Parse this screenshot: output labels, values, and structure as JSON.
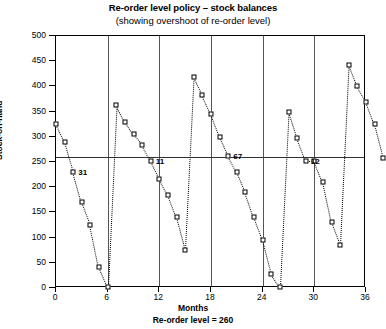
{
  "chart_data": {
    "type": "line",
    "title": "Re-order level policy – stock balances",
    "subtitle": "(showing overshoot of re-order level)",
    "xlabel": "Months",
    "ylabel": "Stock-on-hand",
    "footnote": "Re-order level = 260",
    "xlim": [
      0,
      36
    ],
    "ylim": [
      0,
      500
    ],
    "xticks": [
      0,
      6,
      12,
      18,
      24,
      30,
      36
    ],
    "yticks": [
      0,
      50,
      100,
      150,
      200,
      250,
      300,
      350,
      400,
      450,
      500
    ],
    "grid": "vertical-at-xticks",
    "legend": "none",
    "reorder_level": 260,
    "series": [
      {
        "name": "Stock-on-hand",
        "marker": "open-square",
        "linestyle": "dotted",
        "points": [
          {
            "x": 0,
            "y": 325
          },
          {
            "x": 1,
            "y": 290
          },
          {
            "x": 2,
            "y": 231
          },
          {
            "x": 3,
            "y": 170
          },
          {
            "x": 4,
            "y": 125
          },
          {
            "x": 5,
            "y": 42
          },
          {
            "x": 6,
            "y": 2
          },
          {
            "x": 7,
            "y": 363
          },
          {
            "x": 8,
            "y": 330
          },
          {
            "x": 9,
            "y": 305
          },
          {
            "x": 10,
            "y": 284
          },
          {
            "x": 11,
            "y": 252
          },
          {
            "x": 12,
            "y": 216
          },
          {
            "x": 13,
            "y": 185
          },
          {
            "x": 14,
            "y": 140
          },
          {
            "x": 15,
            "y": 75
          },
          {
            "x": 16,
            "y": 418
          },
          {
            "x": 17,
            "y": 382
          },
          {
            "x": 18,
            "y": 345
          },
          {
            "x": 19,
            "y": 300
          },
          {
            "x": 20,
            "y": 262
          },
          {
            "x": 21,
            "y": 230
          },
          {
            "x": 22,
            "y": 190
          },
          {
            "x": 23,
            "y": 140
          },
          {
            "x": 24,
            "y": 95
          },
          {
            "x": 25,
            "y": 28
          },
          {
            "x": 26,
            "y": 2
          },
          {
            "x": 27,
            "y": 350
          },
          {
            "x": 28,
            "y": 297
          },
          {
            "x": 29,
            "y": 252
          },
          {
            "x": 30,
            "y": 252
          },
          {
            "x": 31,
            "y": 210
          },
          {
            "x": 32,
            "y": 130
          },
          {
            "x": 33,
            "y": 85
          },
          {
            "x": 34,
            "y": 443
          },
          {
            "x": 35,
            "y": 400
          },
          {
            "x": 36,
            "y": 370
          },
          {
            "x": 37,
            "y": 325
          },
          {
            "x": 38,
            "y": 258
          }
        ]
      }
    ],
    "annotations": [
      {
        "text": "31",
        "x": 2,
        "y": 231
      },
      {
        "text": "11",
        "x": 11,
        "y": 252
      },
      {
        "text": "67",
        "x": 20,
        "y": 262
      },
      {
        "text": "12",
        "x": 29,
        "y": 252
      },
      {
        "text": "23",
        "x": 38,
        "y": 258
      }
    ]
  }
}
